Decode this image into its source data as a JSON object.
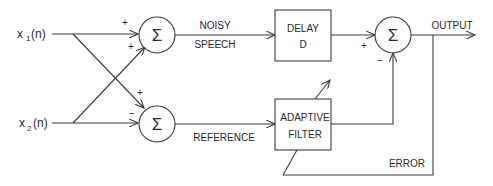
{
  "diagram": {
    "type": "adaptive noise cancellation block diagram",
    "inputs": [
      {
        "id": "x1",
        "label": "x",
        "subscript": "1",
        "suffix": "(n)"
      },
      {
        "id": "x2",
        "label": "x",
        "subscript": "2",
        "suffix": "(n)"
      }
    ],
    "summers": [
      {
        "id": "sum_top",
        "symbol": "Σ",
        "signs": [
          "+",
          "+"
        ]
      },
      {
        "id": "sum_bottom",
        "symbol": "Σ",
        "signs": [
          "+",
          "−"
        ]
      },
      {
        "id": "sum_out",
        "symbol": "Σ",
        "signs": [
          "+",
          "−"
        ]
      }
    ],
    "blocks": [
      {
        "id": "delay",
        "line1": "DELAY",
        "line2": "D"
      },
      {
        "id": "adaptive_filter",
        "line1": "ADAPTIVE",
        "line2": "FILTER"
      }
    ],
    "signal_labels": {
      "noisy_line1": "NOISY",
      "noisy_line2": "SPEECH",
      "reference": "REFERENCE",
      "output": "OUTPUT",
      "error": "ERROR"
    },
    "colors": {
      "stroke": "#3a3a3a",
      "text": "#2a2a2a",
      "background": "#ffffff"
    }
  }
}
